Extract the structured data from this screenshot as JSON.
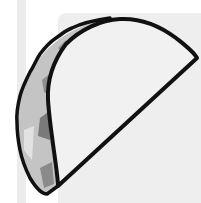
{
  "image": {
    "subject": "taco-illustration",
    "style": "grayscale clip-art",
    "colors": {
      "background": "#ffffff",
      "strip": "#ececec",
      "panel": "#eeeeee",
      "shell_fill": "#f0f0f0",
      "outline": "#111111",
      "filling_light": "#c4c4c4",
      "filling_mid": "#9a9a9a",
      "filling_dark": "#6e6e6e"
    }
  }
}
